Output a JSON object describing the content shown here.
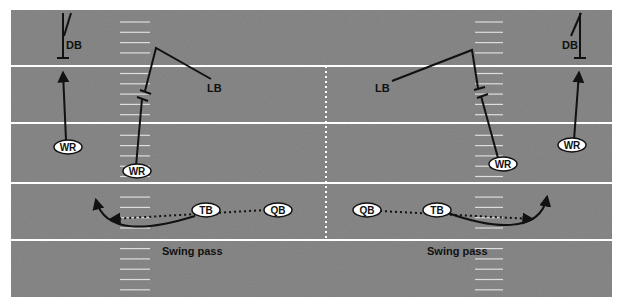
{
  "diagram": {
    "colors": {
      "field": "#8a8a8a",
      "yard_line": "#ffffff",
      "route": "#111111",
      "player_fill": "#ffffff"
    },
    "plays": [
      {
        "caption": "Swing pass",
        "side": "left",
        "players": {
          "db": "DB",
          "lb": "LB",
          "wr_outside": "WR",
          "wr_slot": "WR",
          "tb": "TB",
          "qb": "QB"
        }
      },
      {
        "caption": "Swing pass",
        "side": "right",
        "players": {
          "db": "DB",
          "lb": "LB",
          "wr_outside": "WR",
          "wr_slot": "WR",
          "tb": "TB",
          "qb": "QB"
        }
      }
    ]
  }
}
